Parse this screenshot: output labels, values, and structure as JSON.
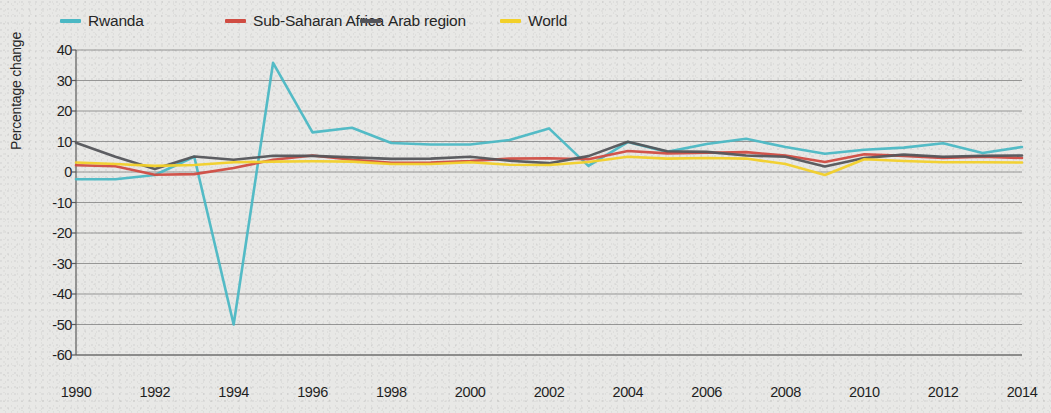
{
  "chart_data": {
    "type": "line",
    "title": "",
    "xlabel": "",
    "ylabel": "Percentage change",
    "xlim": [
      1990,
      2014
    ],
    "ylim": [
      -60,
      40
    ],
    "y_ticks": [
      40,
      30,
      20,
      10,
      0,
      -10,
      -20,
      -30,
      -40,
      -50,
      -60
    ],
    "x_ticks": [
      1990,
      1992,
      1994,
      1996,
      1998,
      2000,
      2002,
      2004,
      2006,
      2008,
      2010,
      2012,
      2014
    ],
    "x": [
      1990,
      1991,
      1992,
      1993,
      1994,
      1995,
      1996,
      1997,
      1998,
      1999,
      2000,
      2001,
      2002,
      2003,
      2004,
      2005,
      2006,
      2007,
      2008,
      2009,
      2010,
      2011,
      2012,
      2013,
      2014
    ],
    "grid": "horizontal",
    "legend_position": "top",
    "series": [
      {
        "name": "Rwanda",
        "color": "#4bb8c4",
        "values": [
          -2.4,
          -2.4,
          -1.0,
          5.0,
          -50.0,
          35.8,
          13.0,
          14.5,
          9.5,
          9.0,
          9.0,
          10.5,
          14.3,
          2.0,
          9.8,
          6.6,
          9.2,
          10.9,
          8.2,
          6.0,
          7.3,
          8.0,
          9.4,
          6.2,
          8.2
        ]
      },
      {
        "name": "Sub-Saharan Africa",
        "color": "#d04c42",
        "values": [
          2.2,
          1.9,
          -0.9,
          -0.7,
          1.3,
          4.0,
          5.4,
          4.0,
          3.0,
          3.1,
          3.6,
          4.4,
          4.5,
          4.2,
          6.9,
          6.1,
          6.3,
          6.5,
          5.4,
          3.3,
          5.8,
          5.3,
          4.6,
          5.0,
          4.6
        ]
      },
      {
        "name": "Arab region",
        "color": "#54555a",
        "values": [
          9.6,
          5.0,
          1.0,
          5.1,
          4.0,
          5.3,
          5.3,
          4.8,
          4.3,
          4.4,
          5.0,
          3.7,
          2.9,
          5.2,
          9.9,
          6.8,
          6.6,
          5.4,
          5.0,
          1.8,
          4.6,
          5.7,
          5.0,
          5.3,
          5.4
        ]
      },
      {
        "name": "World",
        "color": "#f2d029",
        "values": [
          3.1,
          2.6,
          2.0,
          2.3,
          3.2,
          3.4,
          3.5,
          3.4,
          2.6,
          2.6,
          3.2,
          2.4,
          2.3,
          3.3,
          5.0,
          4.4,
          4.6,
          4.4,
          2.6,
          -1.0,
          4.2,
          3.6,
          3.2,
          3.2,
          3.1
        ]
      }
    ]
  },
  "legend": {
    "items": [
      {
        "label": "Rwanda",
        "color": "#4bb8c4"
      },
      {
        "label": "Sub-Saharan Africa",
        "color": "#d04c42"
      },
      {
        "label": "Arab region",
        "color": "#54555a"
      },
      {
        "label": "World",
        "color": "#f2d029"
      }
    ]
  },
  "axes": {
    "y_title": "Percentage change",
    "y_tick_labels": [
      "40",
      "30",
      "20",
      "10",
      "0",
      "-10",
      "-20",
      "-30",
      "-40",
      "-50",
      "-60"
    ],
    "x_tick_labels": [
      "1990",
      "1992",
      "1994",
      "1996",
      "1998",
      "2000",
      "2002",
      "2004",
      "2006",
      "2008",
      "2010",
      "2012",
      "2014"
    ]
  }
}
